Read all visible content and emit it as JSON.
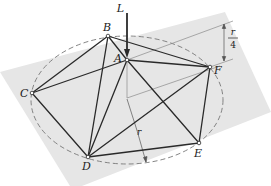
{
  "figure": {
    "colors": {
      "plane": "#e6e6e6",
      "members": "#2a2a2a",
      "dashed_circle": "#777777",
      "construction_lines": "#8a8a8a"
    },
    "load": {
      "label": "L"
    },
    "nodes": [
      {
        "id": "A",
        "label": "A",
        "x": 127,
        "y": 60
      },
      {
        "id": "B",
        "label": "B",
        "x": 108,
        "y": 36
      },
      {
        "id": "C",
        "label": "C",
        "x": 32,
        "y": 93
      },
      {
        "id": "D",
        "label": "D",
        "x": 88,
        "y": 157
      },
      {
        "id": "E",
        "label": "E",
        "x": 199,
        "y": 143
      },
      {
        "id": "F",
        "label": "F",
        "x": 210,
        "y": 67
      }
    ],
    "members": [
      [
        "A",
        "B"
      ],
      [
        "A",
        "C"
      ],
      [
        "A",
        "D"
      ],
      [
        "A",
        "E"
      ],
      [
        "A",
        "F"
      ],
      [
        "B",
        "C"
      ],
      [
        "B",
        "D"
      ],
      [
        "B",
        "F"
      ],
      [
        "C",
        "D"
      ],
      [
        "D",
        "E"
      ],
      [
        "D",
        "F"
      ],
      [
        "E",
        "F"
      ]
    ],
    "dimensions": {
      "height_label_num": "r",
      "height_label_den": "4",
      "radius_label": "r"
    }
  }
}
